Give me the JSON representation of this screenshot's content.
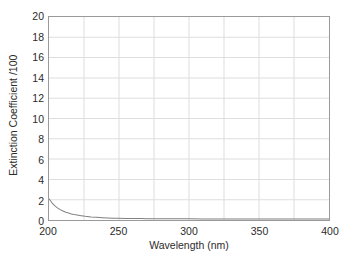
{
  "chart_data": {
    "type": "line",
    "title": "",
    "xlabel": "Wavelength (nm)",
    "ylabel": "Extinction Coefficient /100",
    "xlim": [
      200,
      400
    ],
    "ylim": [
      0,
      20
    ],
    "xticks": [
      200,
      250,
      300,
      350,
      400
    ],
    "yticks": [
      0,
      2,
      4,
      6,
      8,
      10,
      12,
      14,
      16,
      18,
      20
    ],
    "xtick_labels": [
      "200",
      "250",
      "300",
      "350",
      "400"
    ],
    "ytick_labels": [
      "0",
      "2",
      "4",
      "6",
      "8",
      "10",
      "12",
      "14",
      "16",
      "18",
      "20"
    ],
    "x_minor_gridline_step": 25,
    "y_gridline_step": 2,
    "grid": true,
    "legend": false,
    "legend_position": "none",
    "series": [
      {
        "name": "Extinction coefficient",
        "color": "#808080",
        "x": [
          200,
          202,
          204,
          206,
          208,
          210,
          212,
          214,
          216,
          218,
          220,
          223,
          226,
          230,
          234,
          238,
          242,
          246,
          250,
          255,
          260,
          265,
          270,
          275,
          280,
          285,
          290,
          295,
          300,
          310,
          320,
          330,
          340,
          350,
          360,
          370,
          380,
          390,
          400
        ],
        "y": [
          2.1,
          1.72,
          1.42,
          1.2,
          1.02,
          0.88,
          0.77,
          0.68,
          0.6,
          0.54,
          0.49,
          0.42,
          0.36,
          0.3,
          0.26,
          0.23,
          0.2,
          0.18,
          0.17,
          0.15,
          0.14,
          0.14,
          0.13,
          0.13,
          0.13,
          0.12,
          0.12,
          0.12,
          0.12,
          0.11,
          0.11,
          0.11,
          0.1,
          0.1,
          0.1,
          0.1,
          0.1,
          0.1,
          0.1
        ]
      }
    ]
  },
  "style": {
    "curve_color": "#808080",
    "grid_color": "#dedede",
    "frame_color": "#9a9a9a",
    "text_color": "#2b2b2b",
    "background": "#ffffff"
  }
}
